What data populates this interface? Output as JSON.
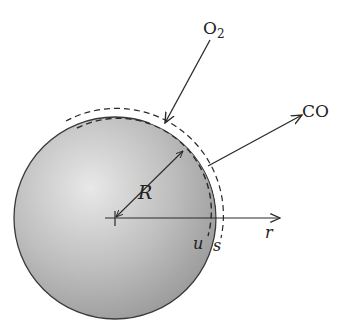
{
  "diagram": {
    "labels": {
      "o2": "O",
      "o2_sub": "2",
      "co": "CO",
      "radius": "R",
      "axis": "r",
      "inner_surface": "u",
      "outer_surface": "s"
    },
    "colors": {
      "sphere_light": "#e6e6e6",
      "sphere_dark": "#9a9a9a",
      "stroke": "#2a2a2a",
      "background": "#ffffff"
    },
    "geometry": {
      "center": [
        115,
        218
      ],
      "radius": 100
    },
    "arrows": [
      {
        "name": "O2 inflow",
        "direction": "toward sphere"
      },
      {
        "name": "CO outflow",
        "direction": "away from sphere"
      },
      {
        "name": "radius R",
        "direction": "center to surface"
      },
      {
        "name": "r axis",
        "direction": "radial outward"
      }
    ]
  }
}
